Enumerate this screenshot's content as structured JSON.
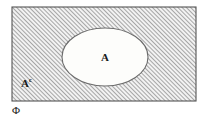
{
  "diagram": {
    "type": "venn-set-diagram",
    "universe": {
      "label": "Φ",
      "label_name": "phi",
      "shape": "rectangle",
      "fill": "hatched",
      "border_color": "#555555",
      "x": 12,
      "y": 7,
      "width": 184,
      "height": 94
    },
    "set": {
      "label": "A",
      "shape": "ellipse",
      "fill": "#fdfdfb",
      "border_color": "#6b6b6b",
      "cx": 105,
      "cy": 57,
      "rx": 43,
      "ry": 29
    },
    "complement": {
      "label_base": "A",
      "label_superscript": "c",
      "region": "hatched-area-outside-ellipse",
      "x": 20,
      "y": 82
    },
    "colors": {
      "hatch_line": "#6e6e6e",
      "hatch_background": "#f2f2f2",
      "page_background": "#ffffff",
      "text": "#1a1a1a"
    },
    "hatch": {
      "angle_degrees": 45,
      "spacing_px": 3,
      "line_width_px": 1
    }
  }
}
